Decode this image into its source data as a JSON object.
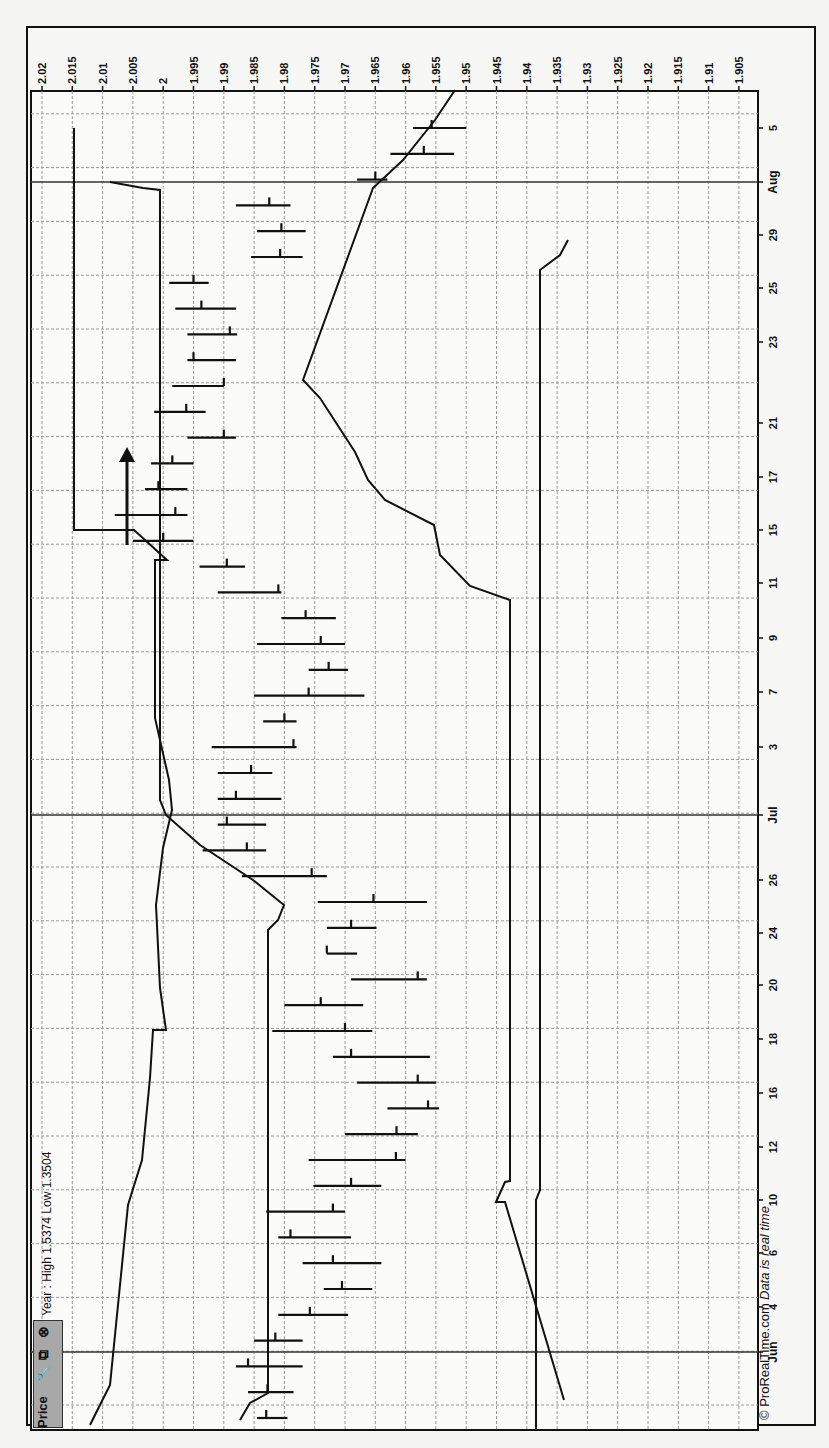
{
  "window": {
    "panel_title": "Price",
    "icons": [
      "wrench-icon",
      "duplicate-icon",
      "close-icon"
    ],
    "info_text": "Year : High 1.5374 Low 1.3504"
  },
  "footer": {
    "copyright": "© ProRealTime.com",
    "realtime_note": "Data is real time"
  },
  "chart_data": {
    "type": "bar",
    "subtype": "OHLC bar chart (rotated 90° counter-clockwise)",
    "title": "Price",
    "annotation": "Year : High 1.5374 Low 1.3504",
    "price_axis": {
      "ticks": [
        "2.02",
        "2.015",
        "2.01",
        "2.005",
        "2",
        "1.995",
        "1.99",
        "1.985",
        "1.98",
        "1.975",
        "1.97",
        "1.965",
        "1.96",
        "1.955",
        "1.95",
        "1.945",
        "1.94",
        "1.935",
        "1.93",
        "1.925",
        "1.92",
        "1.915",
        "1.91",
        "1.905"
      ],
      "range": [
        1.905,
        2.02
      ]
    },
    "date_axis": {
      "ticks": [
        "Jun",
        "4",
        "6",
        "10",
        "12",
        "16",
        "18",
        "20",
        "24",
        "26",
        "Jul",
        "3",
        "7",
        "9",
        "11",
        "15",
        "17",
        "21",
        "23",
        "25",
        "29",
        "Aug",
        "5"
      ]
    },
    "grid": true,
    "bars": [
      {
        "date": "May 30",
        "high": 1.9845,
        "low": 1.9795,
        "close": 1.983
      },
      {
        "date": "May 31",
        "high": 1.986,
        "low": 1.9785,
        "close": 1.9828
      },
      {
        "date": "Jun 1",
        "high": 1.988,
        "low": 1.977,
        "close": 1.986
      },
      {
        "date": "Jun 3",
        "high": 1.985,
        "low": 1.977,
        "close": 1.9815
      },
      {
        "date": "Jun 4",
        "high": 1.981,
        "low": 1.9695,
        "close": 1.9758
      },
      {
        "date": "Jun 5",
        "high": 1.9735,
        "low": 1.9655,
        "close": 1.9705
      },
      {
        "date": "Jun 6",
        "high": 1.977,
        "low": 1.964,
        "close": 1.972
      },
      {
        "date": "Jun 7",
        "high": 1.981,
        "low": 1.969,
        "close": 1.979
      },
      {
        "date": "Jun 10",
        "high": 1.983,
        "low": 1.97,
        "close": 1.972
      },
      {
        "date": "Jun 11",
        "high": 1.9752,
        "low": 1.964,
        "close": 1.969
      },
      {
        "date": "Jun 12",
        "high": 1.976,
        "low": 1.96,
        "close": 1.9616
      },
      {
        "date": "Jun 13",
        "high": 1.97,
        "low": 1.958,
        "close": 1.9615
      },
      {
        "date": "Jun 14",
        "high": 1.963,
        "low": 1.9545,
        "close": 1.9563
      },
      {
        "date": "Jun 17",
        "high": 1.968,
        "low": 1.955,
        "close": 1.958
      },
      {
        "date": "Jun 18",
        "high": 1.972,
        "low": 1.956,
        "close": 1.969
      },
      {
        "date": "Jun 19",
        "high": 1.982,
        "low": 1.9655,
        "close": 1.97
      },
      {
        "date": "Jun 20",
        "high": 1.98,
        "low": 1.967,
        "close": 1.974
      },
      {
        "date": "Jun 21",
        "high": 1.969,
        "low": 1.9565,
        "close": 1.958
      },
      {
        "date": "Jun 24",
        "high": 1.973,
        "low": 1.968,
        "close": 1.973
      },
      {
        "date": "Jun 25",
        "high": 1.973,
        "low": 1.9648,
        "close": 1.969
      },
      {
        "date": "Jun 26",
        "high": 1.9745,
        "low": 1.9565,
        "close": 1.9653
      },
      {
        "date": "Jun 27",
        "high": 1.987,
        "low": 1.973,
        "close": 1.9755
      },
      {
        "date": "Jun 28",
        "high": 1.9935,
        "low": 1.983,
        "close": 1.9862
      },
      {
        "date": "Jun 29",
        "high": 1.991,
        "low": 1.983,
        "close": 1.9895
      },
      {
        "date": "Jul 1",
        "high": 1.991,
        "low": 1.9805,
        "close": 1.988
      },
      {
        "date": "Jul 2",
        "high": 1.991,
        "low": 1.982,
        "close": 1.9855
      },
      {
        "date": "Jul 3",
        "high": 1.992,
        "low": 1.978,
        "close": 1.9785
      },
      {
        "date": "Jul 5",
        "high": 1.9835,
        "low": 1.978,
        "close": 1.98
      },
      {
        "date": "Jul 7",
        "high": 1.985,
        "low": 1.9668,
        "close": 1.976
      },
      {
        "date": "Jul 8",
        "high": 1.976,
        "low": 1.9695,
        "close": 1.9727
      },
      {
        "date": "Jul 9",
        "high": 1.9845,
        "low": 1.97,
        "close": 1.974
      },
      {
        "date": "Jul 10",
        "high": 1.9805,
        "low": 1.9715,
        "close": 1.9765
      },
      {
        "date": "Jul 11",
        "high": 1.991,
        "low": 1.9805,
        "close": 1.981
      },
      {
        "date": "Jul 12",
        "high": 1.994,
        "low": 1.9865,
        "close": 1.9895
      },
      {
        "date": "Jul 15",
        "high": 2.005,
        "low": 1.995,
        "close": 2.0
      },
      {
        "date": "Jul 16",
        "high": 2.008,
        "low": 1.996,
        "close": 1.998
      },
      {
        "date": "Jul 17",
        "high": 2.003,
        "low": 1.996,
        "close": 2.0008
      },
      {
        "date": "Jul 18",
        "high": 2.002,
        "low": 1.995,
        "close": 1.9985
      },
      {
        "date": "Jul 19",
        "high": 1.996,
        "low": 1.988,
        "close": 1.99
      },
      {
        "date": "Jul 22",
        "high": 2.0015,
        "low": 1.993,
        "close": 1.9962
      },
      {
        "date": "Jul 23",
        "high": 1.9985,
        "low": 1.99,
        "close": 1.99
      },
      {
        "date": "Jul 24",
        "high": 1.996,
        "low": 1.988,
        "close": 1.995
      },
      {
        "date": "Jul 25",
        "high": 1.996,
        "low": 1.9878,
        "close": 1.989
      },
      {
        "date": "Jul 26",
        "high": 1.998,
        "low": 1.988,
        "close": 1.9937
      },
      {
        "date": "Jul 29",
        "high": 1.999,
        "low": 1.9925,
        "close": 1.995
      },
      {
        "date": "Jul 30",
        "high": 1.9855,
        "low": 1.977,
        "close": 1.9807
      },
      {
        "date": "Jul 31",
        "high": 1.9845,
        "low": 1.9765,
        "close": 1.9805
      },
      {
        "date": "Aug 1",
        "high": 1.988,
        "low": 1.979,
        "close": 1.9825
      },
      {
        "date": "Aug 2",
        "high": 1.968,
        "low": 1.963,
        "close": 1.965
      },
      {
        "date": "Aug 5",
        "high": 1.9625,
        "low": 1.952,
        "close": 1.957
      },
      {
        "date": "Aug 6",
        "high": 1.9588,
        "low": 1.95,
        "close": 1.9557
      }
    ],
    "overlays": [
      {
        "name": "upper channel line",
        "points_note": "stepped line rising from ~1.99 in early Jun to ~2.015 in mid-Jul"
      },
      {
        "name": "middle channel line",
        "points_note": "step line ~1.985 in Jun rising to ~1.965 band by late Jul"
      },
      {
        "name": "lower channel line",
        "points_note": "~1.94 flat, dipping and reaching ~1.935 at end of July"
      }
    ],
    "annotations": [
      "Arrow pointing up near Jul 12-15 at price ~2.005"
    ],
    "xlabel": "",
    "ylabel": ""
  }
}
